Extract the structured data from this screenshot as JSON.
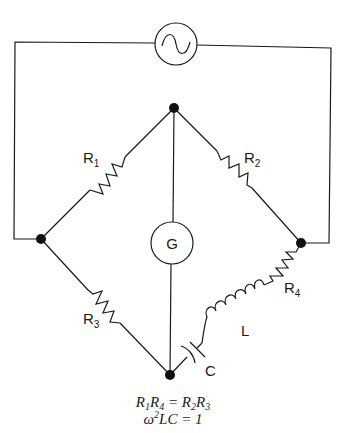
{
  "diagram": {
    "source": {
      "symbol": "~",
      "name": "AC source"
    },
    "galvanometer": {
      "label": "G"
    },
    "components": {
      "R1": {
        "main": "R",
        "sub": "1"
      },
      "R2": {
        "main": "R",
        "sub": "2"
      },
      "R3": {
        "main": "R",
        "sub": "3"
      },
      "R4": {
        "main": "R",
        "sub": "4"
      },
      "L": {
        "label": "L"
      },
      "C": {
        "label": "C"
      }
    },
    "equations": {
      "line1": {
        "a": "R",
        "a_sub": "1",
        "b": "R",
        "b_sub": "4",
        "eq": " = ",
        "c": "R",
        "c_sub": "2",
        "d": "R",
        "d_sub": "3"
      },
      "line2": {
        "omega": "ω",
        "sup": "2",
        "rest": "LC = 1"
      }
    },
    "colors": {
      "ink": "#1a1a1a",
      "background": "#ffffff"
    }
  }
}
